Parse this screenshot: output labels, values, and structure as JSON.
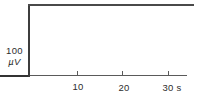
{
  "chart_data": {
    "type": "line",
    "title": "",
    "xlabel": "s",
    "ylabel": "µV",
    "x_ticks_s": [
      10,
      20,
      30
    ],
    "x_tick_labels": [
      "10",
      "20",
      "30 s"
    ],
    "xlim_s": [
      -6.5,
      35
    ],
    "ylim_uV": [
      0,
      100
    ],
    "grid": false,
    "legend": "none",
    "y_scale_bar": {
      "value": "100",
      "unit": "µV",
      "amplitude_uV": 100
    },
    "series": [
      {
        "name": "calibration-step-trace",
        "x_s": [
          -6.5,
          0,
          0,
          36
        ],
        "y_uV": [
          0,
          0,
          100,
          100
        ],
        "description": "flat baseline, vertical 100 µV step at t=0, flat top continuing past 30 s"
      }
    ],
    "colors": {
      "trace": "#3d3d3d",
      "axis": "#5a5a5a",
      "text": "#2d2d2d",
      "background": "#ffffff"
    }
  }
}
